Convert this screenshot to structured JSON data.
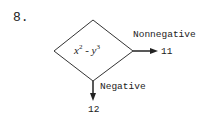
{
  "problem": {
    "number": "8."
  },
  "decision": {
    "expression_base1": "x",
    "expression_exp1": "2",
    "expression_op": " - ",
    "expression_base2": "y",
    "expression_exp2": "3"
  },
  "branches": [
    {
      "label": "Nonnegative",
      "target": "11",
      "direction": "right"
    },
    {
      "label": "Negative",
      "target": "12",
      "direction": "down"
    }
  ]
}
